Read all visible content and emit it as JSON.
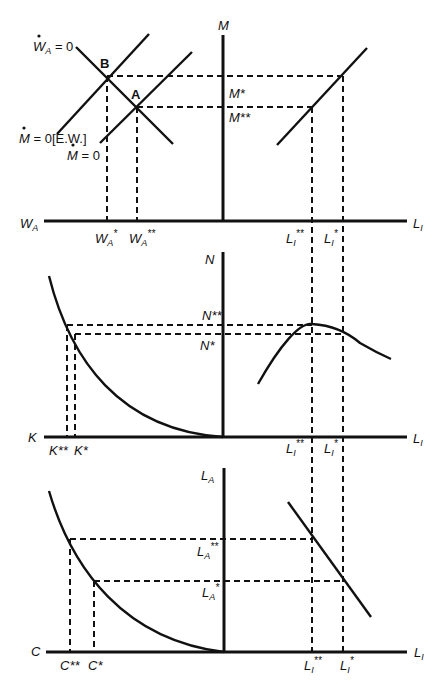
{
  "diagram": {
    "panels": [
      {
        "id": "top",
        "vertical_axis": "M",
        "left_axis": "W_A",
        "right_axis": "L_I",
        "left_curves": [
          "Ẇ_A = 0",
          "Ṁ = 0[E.W.]",
          "Ṁ = 0"
        ],
        "points": [
          "B",
          "A"
        ],
        "vertical_ticks": [
          "M*",
          "M**"
        ],
        "left_ticks": [
          "W_A*",
          "W_A**"
        ],
        "right_ticks": [
          "L_I**",
          "L_I*"
        ]
      },
      {
        "id": "middle",
        "vertical_axis": "N",
        "left_axis": "K",
        "right_axis": "L_I",
        "vertical_ticks": [
          "N**",
          "N*"
        ],
        "left_ticks": [
          "K**",
          "K*"
        ],
        "right_ticks": [
          "L_I**",
          "L_I*"
        ]
      },
      {
        "id": "bottom",
        "vertical_axis": "L_A",
        "left_axis": "C",
        "right_axis": "L_I",
        "vertical_ticks": [
          "L_A**",
          "L_A*"
        ],
        "left_ticks": [
          "C**",
          "C*"
        ],
        "right_ticks": [
          "L_I**",
          "L_I*"
        ]
      }
    ]
  },
  "labels": {
    "M": "M",
    "W": "W",
    "A_sub": "A",
    "L": "L",
    "I_sub": "I",
    "N": "N",
    "K": "K",
    "C": "C",
    "B": "B",
    "A": "A",
    "eq0": " = 0",
    "ew": " = 0[E.W.]",
    "star": "*",
    "dstar": "**",
    "Mstar": "M*",
    "Mdstar": "M**",
    "Nstar": "N*",
    "Ndstar": "N**",
    "Kstar": "K*",
    "Kdstar": "K**",
    "Cstar": "C*",
    "Cdstar": "C**"
  }
}
